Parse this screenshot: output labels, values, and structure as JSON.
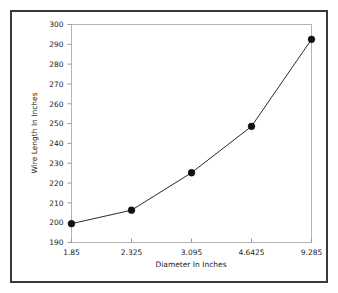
{
  "chart_data": {
    "type": "line",
    "title": "",
    "xlabel": "Diameter In Inches",
    "ylabel": "Wire Length In Inches",
    "categories": [
      "1.85",
      "2.325",
      "3.095",
      "4.6425",
      "9.285"
    ],
    "x_numeric": [
      1.85,
      2.325,
      3.095,
      4.6425,
      9.285
    ],
    "values": [
      199.5,
      206.3,
      225.2,
      248.6,
      292.5
    ],
    "series": [
      {
        "name": "Wire Length",
        "values": [
          199.5,
          206.3,
          225.2,
          248.6,
          292.5
        ]
      }
    ],
    "ylim": [
      190,
      300
    ],
    "ytick_step": 10,
    "yticks": [
      190,
      200,
      210,
      220,
      230,
      240,
      250,
      260,
      270,
      280,
      290,
      300
    ],
    "xticks": [
      "1.85",
      "2.325",
      "3.095",
      "4.6425",
      "9.285"
    ],
    "grid": false,
    "legend": false,
    "legend_position": "none",
    "marker": "filled-circle",
    "x_scale": "categorical",
    "colors": {
      "line": "#2a2a2a",
      "marker": "#101010",
      "plot_frame": "#b4b4b4",
      "outer_frame": "#39393b",
      "background": "#ffffff",
      "text": "#1b1b1b"
    }
  }
}
